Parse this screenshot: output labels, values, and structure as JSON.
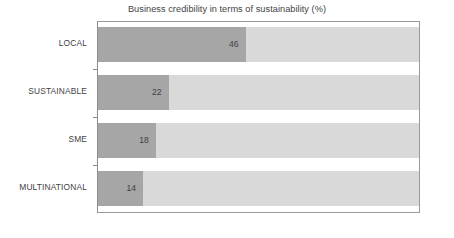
{
  "chart_data": {
    "type": "bar",
    "orientation": "horizontal",
    "title": "Business credibility in terms of sustainability (%)",
    "xlabel": "",
    "ylabel": "",
    "xlim": [
      0,
      100
    ],
    "grid": false,
    "legend": "none",
    "categories": [
      "LOCAL",
      "SUSTAINABLE",
      "SME",
      "MULTINATIONAL"
    ],
    "values": [
      46,
      22,
      18,
      14
    ],
    "value_labels": [
      "46",
      "22",
      "18",
      "14"
    ],
    "series": [
      {
        "name": "Business credibility (%)",
        "values": [
          46,
          22,
          18,
          14
        ]
      }
    ],
    "colors": {
      "bar_fill": "#a6a6a6",
      "bar_track": "#d9d9d9",
      "axis": "#8d8d8d",
      "text": "#3f3f3f",
      "background": "#ffffff"
    }
  },
  "bars": [
    {
      "category": "LOCAL",
      "value": 46,
      "label": "46"
    },
    {
      "category": "SUSTAINABLE",
      "value": 22,
      "label": "22"
    },
    {
      "category": "SME",
      "value": 18,
      "label": "18"
    },
    {
      "category": "MULTINATIONAL",
      "value": 14,
      "label": "14"
    }
  ]
}
